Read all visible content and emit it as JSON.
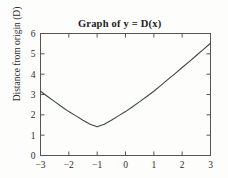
{
  "figure": {
    "title": "Graph of y = D(x)",
    "title_plain": "Graph of y = D(x)",
    "background_color": "#fdfdfc",
    "frame_color": "#555555",
    "curve_color": "#3a4a44"
  },
  "chart_data": {
    "type": "line",
    "title": "Graph of y = D(x)",
    "xlabel": "",
    "ylabel": "Distance from origin (D)",
    "xlim": [
      -3,
      3
    ],
    "ylim": [
      0,
      6
    ],
    "xticks": [
      -3,
      -2,
      -1,
      0,
      1,
      2,
      3
    ],
    "xtick_labels": [
      "-3",
      "-2",
      "-1",
      "0",
      "1",
      "2",
      "3"
    ],
    "yticks": [
      0,
      1,
      2,
      3,
      4,
      5,
      6
    ],
    "ytick_labels": [
      "0",
      "1",
      "2",
      "3",
      "4",
      "5",
      "6"
    ],
    "grid": false,
    "legend": false,
    "frame": "box",
    "tick_direction": "in",
    "series": [
      {
        "name": "D(x)",
        "color": "#3a4a44",
        "linewidth": 1.1,
        "x": [
          -3,
          -2.75,
          -2.5,
          -2.25,
          -2,
          -1.75,
          -1.5,
          -1.25,
          -1,
          -0.75,
          -0.5,
          -0.25,
          0,
          0.25,
          0.5,
          0.75,
          1,
          1.25,
          1.5,
          1.75,
          2,
          2.25,
          2.5,
          2.75,
          3
        ],
        "values": [
          3.16,
          2.9,
          2.65,
          2.4,
          2.16,
          1.95,
          1.73,
          1.54,
          1.41,
          1.54,
          1.73,
          1.95,
          2.16,
          2.4,
          2.65,
          2.9,
          3.16,
          3.45,
          3.74,
          4.03,
          4.33,
          4.62,
          4.92,
          5.22,
          5.52
        ]
      }
    ],
    "annotations": [
      {
        "text": "minimum",
        "x": -1,
        "y": 1.41
      }
    ]
  },
  "axes": {
    "x_tick_labels": [
      "-3",
      "-2",
      "-1",
      "0",
      "1",
      "2",
      "3"
    ],
    "y_tick_labels": [
      "0",
      "1",
      "2",
      "3",
      "4",
      "5",
      "6"
    ],
    "y_axis_title": "Distance from origin (D)"
  }
}
